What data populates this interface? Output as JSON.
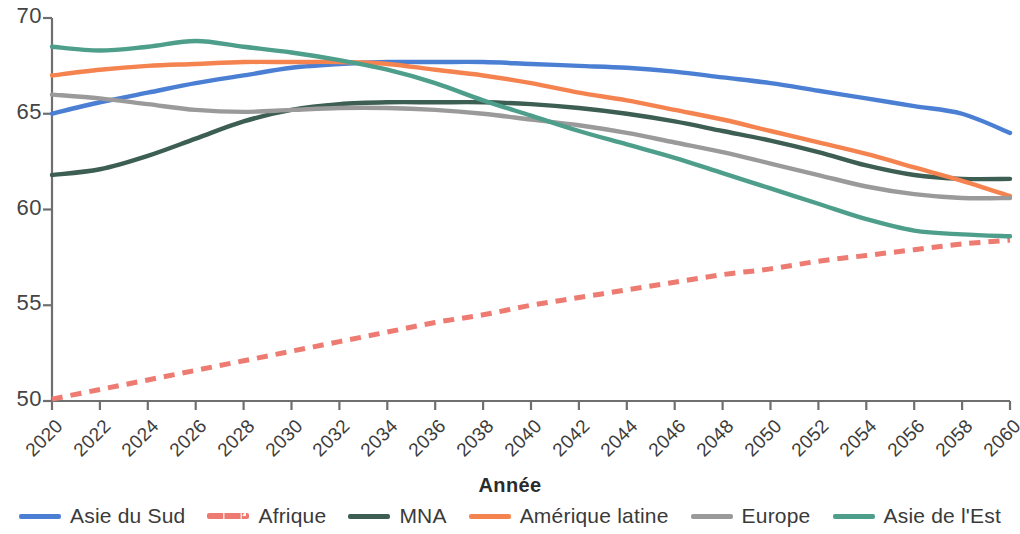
{
  "chart_data": {
    "type": "line",
    "title": "",
    "xlabel": "Année",
    "ylabel": "",
    "grid": false,
    "legend_position": "bottom",
    "xlim": [
      2020,
      2060
    ],
    "ylim": [
      50,
      70
    ],
    "x_ticks": [
      2020,
      2022,
      2024,
      2026,
      2028,
      2030,
      2032,
      2034,
      2036,
      2038,
      2040,
      2042,
      2044,
      2046,
      2048,
      2050,
      2052,
      2054,
      2056,
      2058,
      2060
    ],
    "x_tick_labels": [
      "2020",
      "2022",
      "2024",
      "2026",
      "2028",
      "2030",
      "2032",
      "2034",
      "2036",
      "2038",
      "2040",
      "2042",
      "2044",
      "2046",
      "2048",
      "2050",
      "2052",
      "2054",
      "2056",
      "2058",
      "2060"
    ],
    "y_ticks": [
      70,
      75,
      65,
      60,
      55,
      50
    ],
    "y_tick_labels": [
      "70",
      "80",
      "65",
      "60",
      "55",
      "50"
    ],
    "x": [
      2020,
      2022,
      2024,
      2026,
      2028,
      2030,
      2032,
      2034,
      2036,
      2038,
      2040,
      2042,
      2044,
      2046,
      2048,
      2050,
      2052,
      2054,
      2056,
      2058,
      2060
    ],
    "series": [
      {
        "name": "Asie du Sud",
        "color": "#4a7fd4",
        "style": "solid",
        "values": [
          65.0,
          65.6,
          66.1,
          66.6,
          67.0,
          67.4,
          67.6,
          67.7,
          67.7,
          67.7,
          67.6,
          67.5,
          67.4,
          67.2,
          66.9,
          66.6,
          66.2,
          65.8,
          65.4,
          65.0,
          64.0
        ]
      },
      {
        "name": "Afrique",
        "color": "#ed7b72",
        "style": "dashed",
        "values": [
          50.1,
          50.6,
          51.1,
          51.6,
          52.1,
          52.6,
          53.1,
          53.6,
          54.1,
          54.5,
          55.0,
          55.4,
          55.8,
          56.2,
          56.6,
          56.9,
          57.3,
          57.6,
          57.9,
          58.2,
          58.4
        ]
      },
      {
        "name": "MNA",
        "color": "#3d5e52",
        "style": "solid",
        "values": [
          61.8,
          62.1,
          62.8,
          63.7,
          64.6,
          65.2,
          65.5,
          65.6,
          65.6,
          65.6,
          65.5,
          65.3,
          65.0,
          64.6,
          64.1,
          63.6,
          63.0,
          62.3,
          61.8,
          61.6,
          61.6
        ]
      },
      {
        "name": "Amérique latine",
        "color": "#f5834f",
        "style": "solid",
        "values": [
          67.0,
          67.3,
          67.5,
          67.6,
          67.7,
          67.7,
          67.7,
          67.6,
          67.3,
          67.0,
          66.6,
          66.1,
          65.7,
          65.2,
          64.7,
          64.1,
          63.5,
          62.9,
          62.2,
          61.5,
          60.7
        ]
      },
      {
        "name": "Europe",
        "color": "#9a9a9a",
        "style": "solid",
        "values": [
          66.0,
          65.8,
          65.5,
          65.2,
          65.1,
          65.2,
          65.3,
          65.3,
          65.2,
          65.0,
          64.7,
          64.4,
          64.0,
          63.5,
          63.0,
          62.4,
          61.8,
          61.2,
          60.8,
          60.6,
          60.6
        ]
      },
      {
        "name": "Asie de l'Est",
        "color": "#4d9e8a",
        "style": "solid",
        "values": [
          68.5,
          68.3,
          68.5,
          68.8,
          68.5,
          68.2,
          67.8,
          67.3,
          66.6,
          65.7,
          64.9,
          64.1,
          63.4,
          62.7,
          61.9,
          61.1,
          60.3,
          59.5,
          58.9,
          58.7,
          58.6
        ]
      }
    ]
  },
  "axes": {
    "x_title": "Année"
  },
  "legend": {
    "items": [
      {
        "label": "Asie du Sud",
        "color": "#4a7fd4",
        "style": "solid"
      },
      {
        "label": "Afrique",
        "color": "#ed7b72",
        "style": "dashed"
      },
      {
        "label": "MNA",
        "color": "#3d5e52",
        "style": "solid"
      },
      {
        "label": "Amérique latine",
        "color": "#f5834f",
        "style": "solid"
      },
      {
        "label": "Europe",
        "color": "#9a9a9a",
        "style": "solid"
      },
      {
        "label": "Asie de l'Est",
        "color": "#4d9e8a",
        "style": "solid"
      }
    ]
  }
}
